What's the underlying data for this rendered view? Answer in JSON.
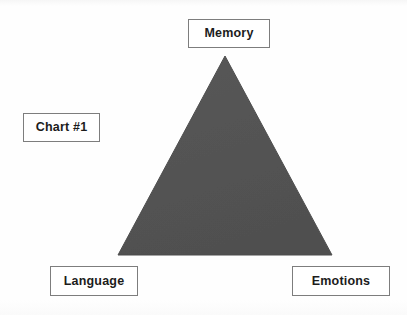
{
  "document": {
    "title": "Chart #1",
    "background_color": "#fdfdfd",
    "width": 407,
    "height": 315
  },
  "chart_data": {
    "type": "diagram",
    "subtype": "triangle-model",
    "title": "Chart #1",
    "shape": {
      "name": "triangle",
      "fill_color": "#555555",
      "stroke_color": "#4d4d4d",
      "vertices": [
        {
          "label": "Memory",
          "x": 225,
          "y": 56
        },
        {
          "label": "Language",
          "x": 118,
          "y": 255
        },
        {
          "label": "Emotions",
          "x": 332,
          "y": 255
        }
      ]
    },
    "nodes": [
      {
        "id": "memory",
        "label": "Memory",
        "position": "top"
      },
      {
        "id": "language",
        "label": "Language",
        "position": "bottom-left"
      },
      {
        "id": "emotions",
        "label": "Emotions",
        "position": "bottom-right"
      }
    ],
    "annotations": [
      {
        "id": "chart-caption",
        "label": "Chart #1",
        "position": "left"
      }
    ],
    "legend": [],
    "grid": false
  },
  "labels": {
    "memory": "Memory",
    "chart_caption": "Chart #1",
    "language": "Language",
    "emotions": "Emotions"
  },
  "colors": {
    "triangle_fill": "#555555",
    "box_border": "#7d7d7d",
    "box_fill": "#ffffff",
    "text": "#1c1c1c"
  }
}
